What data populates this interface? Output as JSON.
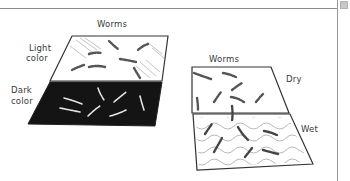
{
  "diagram": {
    "left_panel": {
      "title": "Worms",
      "top_surface_label_line1": "Light",
      "top_surface_label_line2": "color",
      "bottom_surface_label_line1": "Dark",
      "bottom_surface_label_line2": "color"
    },
    "right_panel": {
      "title": "Worms",
      "top_surface_label": "Dry",
      "bottom_surface_label": "Wet"
    }
  },
  "colors": {
    "line": "#3a3a3a",
    "dark_surface": "#141414",
    "worm_on_light": "#555555",
    "worm_on_dark": "#e6e6e6",
    "frame": "#8a8a8a"
  }
}
